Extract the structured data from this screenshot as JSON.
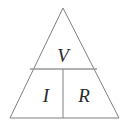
{
  "diagram": {
    "name": "ohms-law-triangle",
    "background_color": "#ffffff",
    "line_color": "#808080",
    "text_color": "#2b2b2b",
    "geometry": {
      "apex": [
        63,
        8
      ],
      "base_left": [
        10,
        118
      ],
      "base_right": [
        119,
        118
      ],
      "divider_y": 69,
      "divider_left_x": 30,
      "divider_right_x": 97,
      "vertical_divider_x": 63
    },
    "cells": [
      {
        "id": "top",
        "label": "V",
        "meaning": "voltage",
        "x": 63,
        "y": 62
      },
      {
        "id": "bottom-left",
        "label": "I",
        "meaning": "current",
        "x": 46,
        "y": 102
      },
      {
        "id": "bottom-right",
        "label": "R",
        "meaning": "resistance",
        "x": 84,
        "y": 102
      }
    ]
  }
}
